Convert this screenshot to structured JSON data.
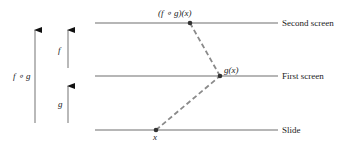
{
  "diagram": {
    "levels": [
      {
        "name": "second-screen",
        "label": "Second screen",
        "y": 23
      },
      {
        "name": "first-screen",
        "label": "First screen",
        "y": 76
      },
      {
        "name": "slide",
        "label": "Slide",
        "y": 130
      }
    ],
    "points": [
      {
        "name": "x",
        "label": "x",
        "px": 156,
        "py": 130
      },
      {
        "name": "g-of-x",
        "label": "g(x)",
        "px": 220,
        "py": 76
      },
      {
        "name": "f-compose-g-of-x",
        "label": "(f ∘ g)(x)",
        "px": 190,
        "py": 23
      }
    ],
    "arrows": [
      {
        "name": "f-compose-g-arrow",
        "label": "f ∘ g"
      },
      {
        "name": "f-arrow",
        "label": "f"
      },
      {
        "name": "g-arrow",
        "label": "g"
      }
    ],
    "colors": {
      "line": "#6e6e6e",
      "dash": "#8a8a8a",
      "point": "#333333",
      "text": "#222222"
    }
  }
}
